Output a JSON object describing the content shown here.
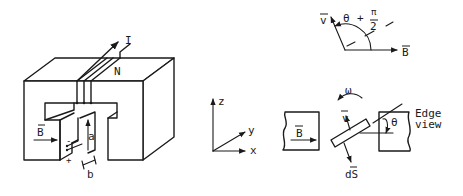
{
  "figure": {
    "magnet": {
      "current_label": "I",
      "turns_label": "N",
      "field_label": "B",
      "gap_height_label": "a",
      "gap_width_label": "b",
      "minus_sign": "-",
      "plus_sign": "+"
    },
    "axes": {
      "z_label": "z",
      "y_label": "y",
      "x_label": "x"
    },
    "angle_diagram": {
      "v_label": "v",
      "b_label": "B",
      "angle_label_theta": "θ",
      "angle_label_plus": "+",
      "angle_label_pi": "π",
      "angle_label_two": "2"
    },
    "edge_view": {
      "field_label": "B",
      "omega_label": "ω",
      "v_label": "v",
      "ds_label": "dS",
      "theta_label": "θ",
      "caption_line1": "Edge",
      "caption_line2": "view"
    }
  }
}
